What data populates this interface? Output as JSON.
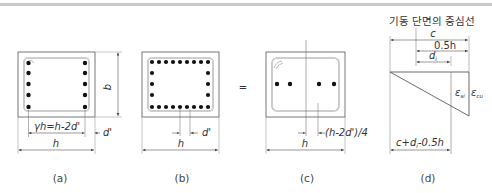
{
  "figure": {
    "panels": [
      {
        "id": "a",
        "caption": "(a)",
        "labels": {
          "inner_dim": "γh=h-2d'",
          "cover": "d'",
          "width": "h",
          "height": "b"
        }
      },
      {
        "id": "b",
        "caption": "(b)",
        "labels": {
          "cover": "d'",
          "width": "h"
        }
      },
      {
        "id": "c",
        "caption": "(c)",
        "labels": {
          "offset": "(h-2d')/4",
          "width": "h"
        }
      },
      {
        "id": "d",
        "caption": "(d)",
        "title": "기동 단면의 중심선",
        "labels": {
          "c": "c",
          "half_h": "0.5h",
          "d_i": "d",
          "d_i_sub": "i",
          "eps_si": "ε",
          "eps_si_sub": "si",
          "eps_cu": "ε",
          "eps_cu_sub": "cu",
          "bottom": "c+d",
          "bottom_sub": "i",
          "bottom_tail": "-0.5h"
        }
      }
    ],
    "equals_sign": "="
  },
  "colors": {
    "line": "#555555",
    "bar": "#111111",
    "stirrup": "#9a9a9a",
    "topbar": "#c8c8c8"
  }
}
